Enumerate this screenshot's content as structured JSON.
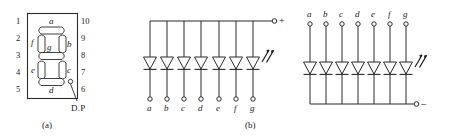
{
  "figure": {
    "stroke_color": "#2b2b2b",
    "text_color": "#1a1a1a",
    "background": "#ffffff"
  },
  "panel_a": {
    "caption": "(a)",
    "decimal_point_label": "D.P",
    "segment_labels": [
      "a",
      "b",
      "c",
      "d",
      "e",
      "f",
      "g"
    ],
    "pins_left": [
      "1",
      "2",
      "3",
      "4",
      "5"
    ],
    "pins_right": [
      "10",
      "9",
      "8",
      "7",
      "6"
    ]
  },
  "panel_b": {
    "caption": "(b)",
    "terminal_sign": "+",
    "polarity": "common anode",
    "led_count": 7,
    "terminal_labels": [
      "a",
      "b",
      "c",
      "d",
      "e",
      "f",
      "g"
    ]
  },
  "panel_c": {
    "caption": "",
    "terminal_sign": "–",
    "polarity": "common cathode",
    "led_count": 7,
    "terminal_labels": [
      "a",
      "b",
      "c",
      "d",
      "e",
      "f",
      "g"
    ]
  }
}
